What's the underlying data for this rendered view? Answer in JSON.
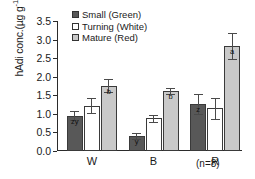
{
  "chart_data": {
    "type": "bar",
    "title": "",
    "xlabel": "",
    "ylabel": "hAdi conc.(µg g⁻¹FW)",
    "ylabel_main": "hAdi conc.(µg g",
    "ylabel_sup": "-1",
    "ylabel_tail": "FW)",
    "categories": [
      "W",
      "B",
      "R"
    ],
    "ylim": [
      0.0,
      3.5
    ],
    "yticks": [
      "0.0",
      "0.5",
      "1.0",
      "1.5",
      "2.0",
      "2.5",
      "3.0",
      "3.5"
    ],
    "ytick_values": [
      0.0,
      0.5,
      1.0,
      1.5,
      2.0,
      2.5,
      3.0,
      3.5
    ],
    "grid": false,
    "legend_position": "top-center",
    "series": [
      {
        "name": "Small (Green)",
        "color": "#585858",
        "values": [
          0.95,
          0.4,
          1.26
        ],
        "errors": [
          0.12,
          0.09,
          0.27
        ],
        "letters": [
          "zy",
          "y",
          "z"
        ]
      },
      {
        "name": "Turning (White)",
        "color": "#ffffff",
        "values": [
          1.22,
          0.88,
          1.15
        ],
        "errors": [
          0.2,
          0.1,
          0.28
        ],
        "letters": [
          "",
          "",
          ""
        ]
      },
      {
        "name": "Mature (Red)",
        "color": "#c9c9c9",
        "values": [
          1.76,
          1.62,
          2.83
        ],
        "errors": [
          0.18,
          0.08,
          0.34
        ],
        "letters": [
          "b",
          "b",
          "a"
        ]
      }
    ],
    "annotation": "(n=8)"
  }
}
